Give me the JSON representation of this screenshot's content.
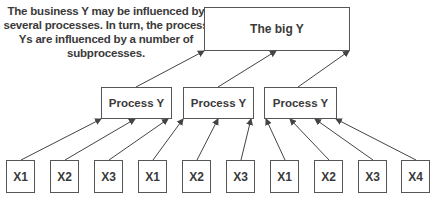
{
  "caption": {
    "line1": "The business Y may be influenced by",
    "line2": "several processes. In turn, the process",
    "line3": "Ys are influenced by a number of",
    "line4": "subprocesses."
  },
  "big_y": {
    "label": "The big Y"
  },
  "processes": [
    {
      "label": "Process Y"
    },
    {
      "label": "Process Y"
    },
    {
      "label": "Process Y"
    }
  ],
  "inputs": [
    {
      "label": "X1",
      "parent": 0
    },
    {
      "label": "X2",
      "parent": 0
    },
    {
      "label": "X3",
      "parent": 0
    },
    {
      "label": "X1",
      "parent": 1
    },
    {
      "label": "X2",
      "parent": 1
    },
    {
      "label": "X3",
      "parent": 1
    },
    {
      "label": "X1",
      "parent": 2
    },
    {
      "label": "X2",
      "parent": 2
    },
    {
      "label": "X3",
      "parent": 2
    },
    {
      "label": "X4",
      "parent": 2
    }
  ],
  "colors": {
    "line": "#444444",
    "border": "#555555",
    "text": "#3a3a3a"
  }
}
